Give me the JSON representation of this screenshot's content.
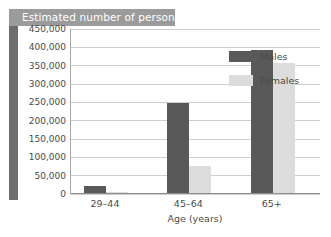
{
  "title": "Estimated number of persons",
  "chart_data": {
    "type": "bar",
    "title": "Estimated number of persons",
    "xlabel": "Age (years)",
    "ylabel": "",
    "categories": [
      "29–44",
      "45–64",
      "65+"
    ],
    "series": [
      {
        "name": "Males",
        "color": "#595959",
        "values": [
          18000,
          245000,
          390000
        ]
      },
      {
        "name": "Females",
        "color": "#dcdcdc",
        "values": [
          4000,
          75000,
          355000
        ]
      }
    ],
    "ylim": [
      0,
      450000
    ],
    "ytick_labels": [
      "450,000",
      "400,000",
      "350,000",
      "300,000",
      "250,000",
      "200,000",
      "150,000",
      "100,000",
      "50,000",
      "0"
    ],
    "ytick_values": [
      450000,
      400000,
      350000,
      300000,
      250000,
      200000,
      150000,
      100000,
      50000,
      0
    ],
    "grid": true,
    "legend_position": "right"
  },
  "legend": [
    {
      "label": "Males",
      "color": "#595959"
    },
    {
      "label": "Females",
      "color": "#dcdcdc"
    }
  ]
}
